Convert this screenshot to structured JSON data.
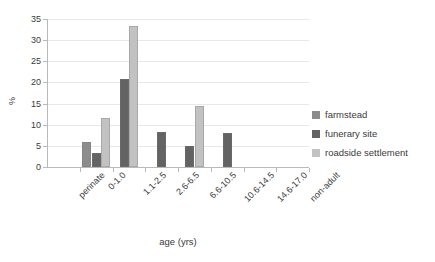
{
  "chart_data": {
    "type": "bar",
    "title": "",
    "xlabel": "age (yrs)",
    "ylabel": "%",
    "categories": [
      "perinate",
      "0-1.0",
      "1.1-2.5",
      "2.6-6.5",
      "6.6-10.5",
      "10.6-14.5",
      "14.6-17.0",
      "non-adult"
    ],
    "ylim": [
      0,
      35
    ],
    "yticks": [
      0,
      5,
      10,
      15,
      20,
      25,
      30,
      35
    ],
    "grid": true,
    "legend_position": "right",
    "series": [
      {
        "name": "farmstead",
        "color": "#8c8c8c",
        "values": [
          0,
          6.0,
          0,
          0,
          0,
          0,
          0,
          0
        ]
      },
      {
        "name": "funerary site",
        "color": "#636363",
        "values": [
          0,
          3.3,
          20.7,
          8.2,
          5.0,
          8.0,
          0,
          0
        ]
      },
      {
        "name": "roadside settlement",
        "color": "#c2c2c2",
        "values": [
          0,
          11.5,
          33.3,
          0,
          14.4,
          0,
          0,
          0
        ]
      }
    ]
  }
}
